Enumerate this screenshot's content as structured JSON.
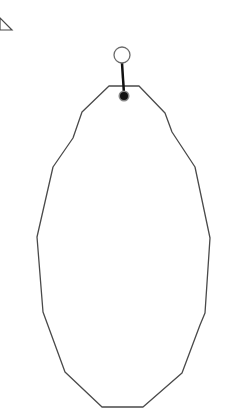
{
  "canvas": {
    "width": 229,
    "height": 419,
    "background": "#ffffff"
  },
  "colors": {
    "stroke": "#4a4a4a",
    "handle": "#111111",
    "handle_ring": "#888888"
  },
  "shapes": {
    "corner_triangle": {
      "points": "0,18 12,30 0,30"
    },
    "polygon": {
      "points": "109,86 139,86 165,113 172,132 195,167 210,238 205,313 200,325 182,373 143,407 102,407 65,372 43,312 37,237 53,167 73,138 82,112"
    },
    "rotation_handle": {
      "cx": 122,
      "cy": 55,
      "r": 8,
      "stem_top": 63,
      "stem_bottom": 94
    },
    "anchor_point": {
      "cx": 124,
      "cy": 96,
      "r": 4
    }
  }
}
